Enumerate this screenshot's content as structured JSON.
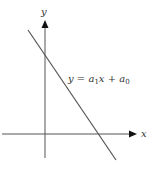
{
  "diagram": {
    "axes": {
      "x_label": "x",
      "y_label": "y"
    },
    "equation": {
      "lhs": "y",
      "eq": " = ",
      "a1": "a",
      "a1_sub": "1",
      "x": "x",
      "plus": " + ",
      "a0": "a",
      "a0_sub": "0"
    },
    "colors": {
      "axis": "#444444",
      "line": "#555555",
      "text": "#333333",
      "background": "#ffffff"
    }
  }
}
